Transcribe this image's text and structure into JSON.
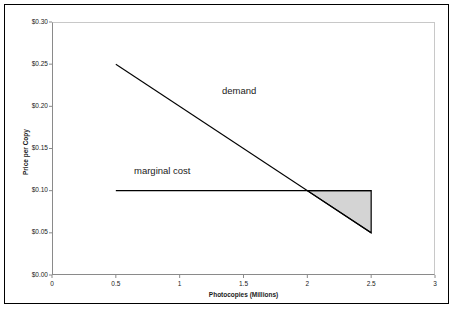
{
  "chart_data": {
    "type": "line",
    "title": "",
    "xlabel": "Photocopies (Millions)",
    "ylabel": "Price per Copy",
    "xlim": [
      0,
      3
    ],
    "ylim": [
      0,
      0.3
    ],
    "grid": false,
    "legend_position": "inline-annotations",
    "x_ticks": [
      "0",
      "0.5",
      "1",
      "1.5",
      "2",
      "2.5",
      "3"
    ],
    "x_tick_values": [
      0,
      0.5,
      1,
      1.5,
      2,
      2.5,
      3
    ],
    "y_ticks": [
      "$0.00",
      "$0.05",
      "$0.10",
      "$0.15",
      "$0.20",
      "$0.25",
      "$0.30"
    ],
    "y_tick_values": [
      0,
      0.05,
      0.1,
      0.15,
      0.2,
      0.25,
      0.3
    ],
    "series": [
      {
        "name": "demand",
        "x": [
          0.5,
          2.5
        ],
        "values": [
          0.25,
          0.05
        ],
        "color": "#000000"
      },
      {
        "name": "marginal cost",
        "x": [
          0.5,
          2.5
        ],
        "values": [
          0.1,
          0.1
        ],
        "color": "#000000"
      }
    ],
    "annotations": [
      {
        "text": "demand",
        "x": 1.62,
        "y": 0.215
      },
      {
        "text": "marginal cost",
        "x": 1.01,
        "y": 0.118
      }
    ],
    "shaded_region": {
      "name": "deadweight-loss-triangle",
      "fill": "#d4d4d4",
      "stroke": "#000000",
      "points": [
        {
          "x": 2.0,
          "y": 0.1
        },
        {
          "x": 2.5,
          "y": 0.1
        },
        {
          "x": 2.5,
          "y": 0.05
        }
      ]
    },
    "intersection_point": {
      "x": 2.0,
      "y": 0.1
    }
  },
  "colors": {
    "plot_background": "#ffffff",
    "axis_line": "#8a8a8a",
    "outer_frame": "#000000",
    "line": "#000000",
    "shade_fill": "#d4d4d4",
    "text": "#1a1a1a"
  }
}
